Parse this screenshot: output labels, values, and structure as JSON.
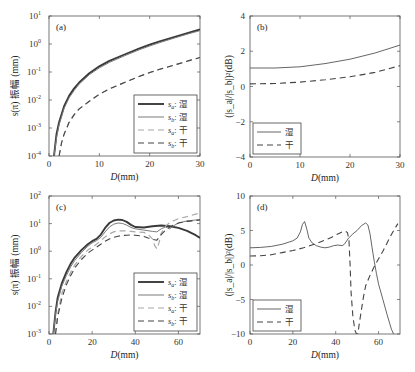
{
  "chart_data": [
    {
      "id": "a",
      "type": "line",
      "panel_label": "(a)",
      "xlabel": "D(mm)",
      "ylabel": "s(π) 振幅 (mm)",
      "yscale": "log",
      "xlim": [
        0,
        30
      ],
      "ylim": [
        0.0001,
        10
      ],
      "xticks": [
        0,
        10,
        20,
        30
      ],
      "yticks": [
        0.0001,
        0.001,
        0.01,
        0.1,
        1,
        10
      ],
      "ytick_labels": [
        [
          "10",
          "-4"
        ],
        [
          "10",
          "-3"
        ],
        [
          "10",
          "-2"
        ],
        [
          "10",
          "-1"
        ],
        [
          "10",
          "0"
        ],
        [
          "10",
          "1"
        ]
      ],
      "legend_position": "bottom-right",
      "series": [
        {
          "name": "s_a: 湿",
          "sub": "a",
          "tag": "湿",
          "style": "thick-dark-solid",
          "x": [
            1.0,
            1.5,
            2,
            3,
            4,
            5,
            6,
            8,
            10,
            12,
            15,
            18,
            20,
            22,
            25,
            28,
            30
          ],
          "y": [
            0.0001,
            0.0006,
            0.0016,
            0.006,
            0.014,
            0.026,
            0.042,
            0.09,
            0.16,
            0.25,
            0.42,
            0.7,
            0.95,
            1.25,
            1.8,
            2.6,
            3.3
          ]
        },
        {
          "name": "s_b: 湿",
          "sub": "b",
          "tag": "湿",
          "style": "thin-gray-solid",
          "x": [
            1.0,
            1.5,
            2,
            3,
            4,
            5,
            6,
            8,
            10,
            12,
            15,
            18,
            20,
            22,
            25,
            28,
            30
          ],
          "y": [
            0.0001,
            0.00045,
            0.0013,
            0.005,
            0.012,
            0.022,
            0.037,
            0.08,
            0.14,
            0.22,
            0.38,
            0.63,
            0.85,
            1.12,
            1.65,
            2.4,
            3.0
          ]
        },
        {
          "name": "s_a: 干",
          "sub": "a",
          "tag": "干",
          "style": "light-gray-dashed",
          "x": [
            2.0,
            2.5,
            3,
            4,
            5,
            6,
            8,
            10,
            12,
            15,
            18,
            20,
            22,
            25,
            28,
            30
          ],
          "y": [
            0.0001,
            0.0003,
            0.0006,
            0.0016,
            0.003,
            0.0048,
            0.009,
            0.016,
            0.025,
            0.042,
            0.07,
            0.095,
            0.125,
            0.18,
            0.26,
            0.33
          ]
        },
        {
          "name": "s_b: 干",
          "sub": "b",
          "tag": "干",
          "style": "dark-dashed",
          "x": [
            2.0,
            2.5,
            3,
            4,
            5,
            6,
            8,
            10,
            12,
            15,
            18,
            20,
            22,
            25,
            28,
            30
          ],
          "y": [
            0.0001,
            0.0003,
            0.0006,
            0.0016,
            0.003,
            0.0048,
            0.009,
            0.016,
            0.025,
            0.042,
            0.07,
            0.095,
            0.125,
            0.18,
            0.26,
            0.33
          ]
        }
      ]
    },
    {
      "id": "b",
      "type": "line",
      "panel_label": "(b)",
      "xlabel": "D(mm)",
      "ylabel": "(|s_a|/|s_b|)²(dB)",
      "yscale": "linear",
      "xlim": [
        0,
        30
      ],
      "ylim": [
        -4,
        4
      ],
      "xticks": [
        0,
        10,
        20,
        30
      ],
      "yticks": [
        -4,
        -2,
        0,
        2,
        4
      ],
      "legend_position": "bottom-left",
      "series": [
        {
          "name": "湿",
          "style": "thin-dark-solid",
          "x": [
            0,
            5,
            10,
            15,
            20,
            25,
            30
          ],
          "y": [
            1.05,
            1.05,
            1.12,
            1.3,
            1.55,
            1.9,
            2.35
          ]
        },
        {
          "name": "干",
          "style": "dark-dashed",
          "x": [
            0,
            5,
            10,
            15,
            20,
            25,
            30
          ],
          "y": [
            0.15,
            0.17,
            0.25,
            0.38,
            0.55,
            0.8,
            1.18
          ]
        }
      ]
    },
    {
      "id": "c",
      "type": "line",
      "panel_label": "(c)",
      "xlabel": "D(mm)",
      "ylabel": "s(π) 振幅 (mm)",
      "yscale": "log",
      "xlim": [
        0,
        70
      ],
      "ylim": [
        0.001,
        100
      ],
      "xticks": [
        0,
        20,
        40,
        60
      ],
      "yticks": [
        0.001,
        0.01,
        0.1,
        1,
        10,
        100
      ],
      "ytick_labels": [
        [
          "10",
          "-3"
        ],
        [
          "10",
          "-2"
        ],
        [
          "10",
          "-1"
        ],
        [
          "10",
          "0"
        ],
        [
          "10",
          "1"
        ],
        [
          "10",
          "2"
        ]
      ],
      "legend_position": "bottom-right",
      "series": [
        {
          "name": "s_a: 湿",
          "sub": "a",
          "tag": "湿",
          "style": "thick-dark-solid",
          "x": [
            2,
            3,
            4,
            6,
            8,
            10,
            12,
            15,
            18,
            20,
            22,
            24,
            26,
            28,
            30,
            32,
            34,
            36,
            38,
            40,
            44,
            48,
            52,
            56,
            60,
            64,
            68,
            70
          ],
          "y": [
            0.001,
            0.006,
            0.02,
            0.07,
            0.17,
            0.35,
            0.6,
            1.1,
            1.8,
            2.3,
            2.8,
            4.0,
            7.0,
            10.5,
            13.0,
            14.0,
            13.5,
            11.5,
            9.0,
            7.5,
            7.2,
            8.0,
            8.5,
            8.0,
            7.0,
            5.5,
            3.8,
            3.0
          ]
        },
        {
          "name": "s_b: 湿",
          "sub": "b",
          "tag": "湿",
          "style": "thin-gray-solid",
          "x": [
            2,
            3,
            4,
            6,
            8,
            10,
            12,
            15,
            18,
            20,
            22,
            24,
            26,
            28,
            30,
            32,
            34,
            36,
            38,
            40,
            44,
            48,
            50,
            52,
            54,
            56,
            58,
            60,
            64,
            68,
            70
          ],
          "y": [
            0.001,
            0.005,
            0.015,
            0.055,
            0.13,
            0.27,
            0.47,
            0.9,
            1.5,
            2.0,
            2.4,
            3.2,
            5.0,
            7.5,
            9.5,
            10.5,
            10.2,
            8.8,
            7.2,
            6.5,
            5.8,
            5.2,
            5.0,
            6.5,
            7.5,
            6.5,
            8.5,
            10.5,
            12.5,
            13.5,
            14.0
          ]
        },
        {
          "name": "s_a: 干",
          "sub": "a",
          "tag": "干",
          "style": "light-gray-dashed",
          "x": [
            3,
            4,
            6,
            8,
            10,
            12,
            15,
            18,
            20,
            22,
            24,
            26,
            28,
            30,
            32,
            34,
            36,
            38,
            40,
            44,
            46,
            48,
            49,
            50,
            51,
            52,
            54,
            56,
            58,
            60,
            64,
            68,
            70
          ],
          "y": [
            0.001,
            0.005,
            0.03,
            0.08,
            0.17,
            0.32,
            0.65,
            1.1,
            1.4,
            1.8,
            2.4,
            3.3,
            4.2,
            5.0,
            5.5,
            5.5,
            5.4,
            5.2,
            5.0,
            4.8,
            4.0,
            2.8,
            1.6,
            1.2,
            2.0,
            4.5,
            8.0,
            11.0,
            13.0,
            15.0,
            18.0,
            22.0,
            24.0
          ]
        },
        {
          "name": "s_b: 干",
          "sub": "b",
          "tag": "干",
          "style": "dark-dashed",
          "x": [
            3,
            4,
            6,
            8,
            10,
            12,
            15,
            18,
            20,
            22,
            24,
            26,
            28,
            30,
            32,
            34,
            36,
            38,
            40,
            42,
            44,
            46,
            48,
            50,
            52,
            54,
            56,
            58,
            60,
            64,
            68,
            70
          ],
          "y": [
            0.001,
            0.004,
            0.02,
            0.06,
            0.13,
            0.25,
            0.5,
            0.85,
            1.1,
            1.4,
            1.8,
            2.3,
            2.8,
            3.2,
            3.5,
            3.7,
            3.8,
            3.9,
            3.8,
            3.6,
            3.4,
            3.0,
            2.7,
            2.5,
            4.0,
            5.8,
            7.5,
            9.0,
            10.5,
            12.0,
            13.0,
            13.5
          ]
        }
      ]
    },
    {
      "id": "d",
      "type": "line",
      "panel_label": "(d)",
      "xlabel": "D(mm)",
      "ylabel": "(|s_a|/|s_b|)²(dB)",
      "yscale": "linear",
      "xlim": [
        0,
        70
      ],
      "ylim": [
        -10,
        10
      ],
      "xticks": [
        0,
        20,
        40,
        60
      ],
      "yticks": [
        -10,
        -5,
        0,
        5,
        10
      ],
      "legend_position": "bottom-left",
      "series": [
        {
          "name": "湿",
          "style": "thin-dark-solid",
          "x": [
            0,
            5,
            10,
            15,
            20,
            22,
            23.5,
            24.5,
            25.5,
            26.5,
            27.5,
            29,
            31,
            33,
            35,
            37,
            39,
            41,
            43,
            44,
            46,
            48,
            50,
            52,
            54,
            55,
            56,
            57,
            58,
            59,
            60,
            62,
            64,
            66,
            67
          ],
          "y": [
            2.5,
            2.55,
            2.7,
            3.0,
            3.5,
            3.9,
            4.8,
            5.9,
            6.3,
            5.2,
            3.9,
            3.2,
            2.8,
            2.6,
            2.5,
            2.6,
            2.8,
            2.9,
            2.8,
            3.0,
            3.9,
            4.5,
            5.0,
            5.7,
            6.1,
            5.8,
            4.5,
            2.5,
            0.5,
            -1.2,
            -2.8,
            -5.0,
            -7.2,
            -9.3,
            -10.0
          ]
        },
        {
          "name": "干",
          "style": "dark-dashed",
          "x": [
            0,
            5,
            10,
            15,
            20,
            25,
            30,
            35,
            38,
            41,
            43,
            44.5,
            45.5,
            46.2,
            46.7,
            47.2,
            48,
            49,
            49.7,
            50.3,
            51,
            52,
            53,
            54,
            56,
            58,
            60,
            62,
            64,
            66,
            68,
            69
          ],
          "y": [
            1.3,
            1.35,
            1.5,
            1.8,
            2.1,
            2.5,
            3.0,
            3.6,
            4.0,
            4.5,
            4.8,
            4.9,
            4.7,
            3.5,
            0.0,
            -4.0,
            -7.5,
            -9.5,
            -10.0,
            -10.0,
            -8.5,
            -6.5,
            -4.5,
            -3.0,
            -1.5,
            -0.2,
            0.9,
            2.0,
            3.2,
            4.4,
            5.5,
            6.0
          ]
        }
      ]
    }
  ]
}
